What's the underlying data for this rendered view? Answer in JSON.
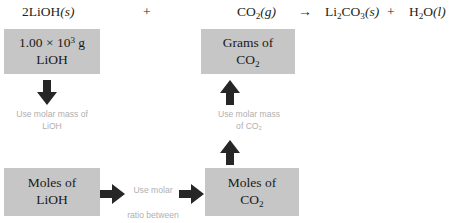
{
  "equation": {
    "reactant1": {
      "coefficient": "2",
      "formula": "LiOH",
      "state": "(s)"
    },
    "plus1": "+",
    "reactant2": {
      "formula_main": "CO",
      "formula_sub": "2",
      "state": "(g)"
    },
    "arrow": "→",
    "product1": {
      "p1": "Li",
      "s1": "2",
      "p2": "CO",
      "s2": "3",
      "state": "(s)"
    },
    "plus2": "+",
    "product2": {
      "p1": "H",
      "s1": "2",
      "p2": "O",
      "state": "(l)"
    }
  },
  "boxes": {
    "grams_lioh": {
      "value": "1.00 × 10",
      "exponent": "3",
      "unit": " g",
      "line2": "LiOH"
    },
    "grams_co2": {
      "line1": "Grams of",
      "line2_main": "CO",
      "line2_sub": "2"
    },
    "moles_lioh": {
      "line1": "Moles of",
      "line2": "LiOH"
    },
    "moles_co2": {
      "line1": "Moles of",
      "line2_main": "CO",
      "line2_sub": "2"
    }
  },
  "captions": {
    "left": "Use molar mass of\nLiOH",
    "right": "Use molar mass\nof CO₂",
    "middle_line1": "Use molar",
    "middle_line2": "ratio between",
    "middle_line3_pre": "CO",
    "middle_line3_sub": "2",
    "middle_line3_post": " and LiOH"
  },
  "colors": {
    "box_fill": "#c6c6c6",
    "arrow_fill": "#262626",
    "caption_text": "#b0b0b0",
    "body_text": "#1a1a1a",
    "background": "#ffffff"
  }
}
